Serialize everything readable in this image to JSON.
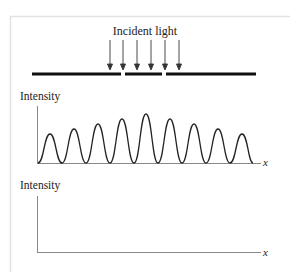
{
  "diagram": {
    "top_label": "Incident light",
    "arrows_count": 6,
    "graph1": {
      "ylabel": "Intensity",
      "xlabel": "x"
    },
    "graph2": {
      "ylabel": "Intensity",
      "xlabel": "x"
    }
  },
  "colors": {
    "ink": "#111111",
    "axis": "#777777",
    "frame": "#e0e0e0"
  }
}
